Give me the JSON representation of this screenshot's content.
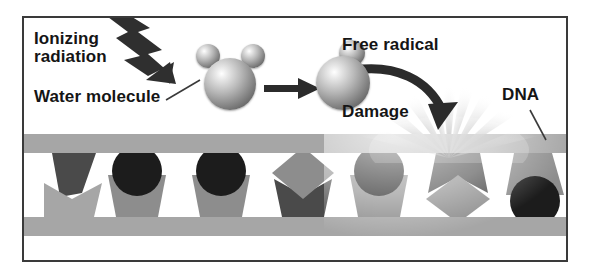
{
  "figure": {
    "labels": {
      "ionizing_radiation": "Ionizing\nradiation",
      "water_molecule": "Water molecule",
      "free_radical": "Free radical",
      "damage": "Damage",
      "dna": "DNA"
    },
    "colors": {
      "frame_border": "#3a3a3a",
      "background": "#ffffff",
      "strand_gray": "#a6a6a6",
      "base_mid_gray": "#8d8d8d",
      "base_dark": "#4a4a4a",
      "base_black": "#1c1c1c",
      "arrow_dark": "#2b2b2b",
      "text": "#151515"
    },
    "elements": {
      "lightning_bolt": "zigzag-arrow-icon",
      "reaction_arrow": "right-arrow-icon",
      "damage_arrow": "curved-arrow-icon",
      "starburst": "starburst-icon",
      "water_molecule_icon": "sphere-cluster-icon",
      "free_radical_icon": "sphere-cluster-icon"
    },
    "molecules": {
      "water": {
        "oxygen_count": 1,
        "hydrogen_count": 2
      },
      "free_radical": {
        "oxygen_count": 1,
        "hydrogen_count": 1
      }
    },
    "dna": {
      "strand_top_y": 116,
      "strand_bottom_y": 199,
      "bases": [
        {
          "index": 0,
          "side": "top",
          "shape": "wedge",
          "tone": "dark",
          "x": 28,
          "width": 44
        },
        {
          "index": 1,
          "side": "bottom",
          "shape": "cup",
          "tone": "mid",
          "x": 20,
          "width": 52,
          "cap": "none"
        },
        {
          "index": 2,
          "side": "bottom",
          "shape": "cup",
          "tone": "mid",
          "x": 84,
          "width": 54,
          "cap": "circle-black"
        },
        {
          "index": 3,
          "side": "bottom",
          "shape": "cup",
          "tone": "mid",
          "x": 168,
          "width": 54,
          "cap": "circle-black"
        },
        {
          "index": 4,
          "side": "bottom",
          "shape": "cup",
          "tone": "dark",
          "x": 250,
          "width": 54,
          "cap": "diamond-mid"
        },
        {
          "index": 5,
          "side": "bottom",
          "shape": "cup",
          "tone": "mid",
          "x": 326,
          "width": 54,
          "cap": "circle-black"
        },
        {
          "index": 6,
          "side": "top",
          "shape": "wedge",
          "tone": "dark",
          "x": 404,
          "width": 56,
          "cap": "diamond-mid"
        },
        {
          "index": 7,
          "side": "top",
          "shape": "wedge",
          "tone": "mid",
          "x": 482,
          "width": 54,
          "cap": "circle-black"
        }
      ]
    }
  }
}
